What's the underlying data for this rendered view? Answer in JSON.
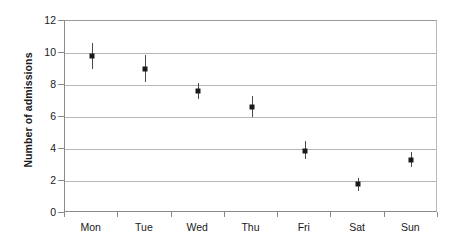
{
  "chart_data": {
    "type": "scatter",
    "title": "",
    "xlabel": "",
    "ylabel": "Number of admissions",
    "categories": [
      "Mon",
      "Tue",
      "Wed",
      "Thu",
      "Fri",
      "Sat",
      "Sun"
    ],
    "values": [
      9.8,
      9.0,
      7.6,
      6.6,
      3.9,
      1.8,
      3.3
    ],
    "error_low": [
      9.0,
      8.2,
      7.1,
      6.0,
      3.4,
      1.4,
      2.9
    ],
    "error_high": [
      10.6,
      9.9,
      8.1,
      7.3,
      4.5,
      2.2,
      3.8
    ],
    "ylim": [
      0,
      12
    ],
    "yticks": [
      0,
      2,
      4,
      6,
      8,
      10,
      12
    ],
    "ytick_labels": [
      "0",
      "2",
      "4",
      "6",
      "8",
      "10",
      "12"
    ],
    "grid": true,
    "grid_axis": "y",
    "legend": null,
    "marker": "square",
    "marker_color": "#1a1a1a",
    "errorbar_color": "#4a4a4a",
    "plot_background": "#ffffff",
    "gridline_color": "#b5b5b5",
    "axis_color": "#8a8a8a"
  }
}
